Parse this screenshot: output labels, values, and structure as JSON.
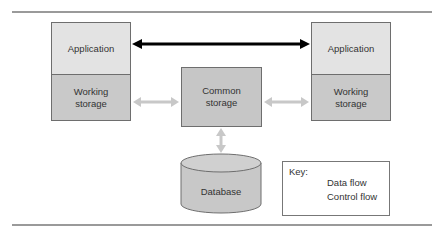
{
  "diagram": {
    "left_stack": {
      "application_label": "Application",
      "working_storage_label": "Working\nstorage"
    },
    "right_stack": {
      "application_label": "Application",
      "working_storage_label": "Working\nstorage"
    },
    "common_storage_label": "Common\nstorage",
    "database_label": "Database",
    "connections": [
      {
        "from": "left-application",
        "to": "right-application",
        "type": "control_flow",
        "bidirectional": true
      },
      {
        "from": "left-working-storage",
        "to": "common-storage",
        "type": "data_flow",
        "bidirectional": true
      },
      {
        "from": "common-storage",
        "to": "right-working-storage",
        "type": "data_flow",
        "bidirectional": true
      },
      {
        "from": "common-storage",
        "to": "database",
        "type": "data_flow",
        "bidirectional": true
      }
    ]
  },
  "key": {
    "title": "Key:",
    "items": [
      {
        "label": "Data flow",
        "color": "#c8c8c8"
      },
      {
        "label": "Control flow",
        "color": "#000000"
      }
    ]
  },
  "colors": {
    "application_fill": "#e3e3e3",
    "working_storage_fill": "#c9c9c9",
    "common_storage_fill": "#c6c6c6",
    "database_fill": "#c8c8c8",
    "data_flow": "#c8c8c8",
    "control_flow": "#000000"
  }
}
